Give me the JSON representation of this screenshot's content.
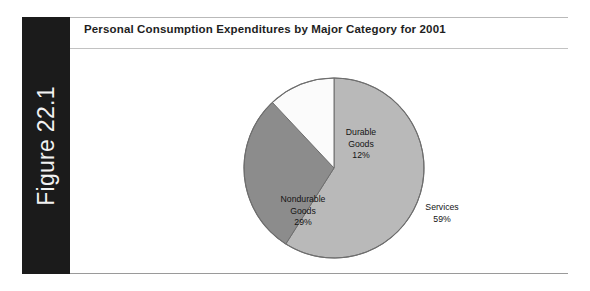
{
  "figure": {
    "number_label": "Figure 22.1",
    "title": "Personal Consumption Expenditures by Major Category for 2001"
  },
  "colors": {
    "tab_background": "#1b1b1b",
    "tab_text": "#f2f2f2",
    "page_background": "#ffffff",
    "rule": "#b9b9b9",
    "slice_services": "#b9b9b9",
    "slice_nondurable": "#8c8c8c",
    "slice_durable": "#fbfbfb",
    "slice_outline": "#6e6e6e",
    "title_text": "#1e1e1e",
    "label_text": "#141414"
  },
  "chart_data": {
    "type": "pie",
    "title": "Personal Consumption Expenditures by Major Category for 2001",
    "subtitle": "",
    "xlabel": "",
    "ylabel": "",
    "legend": "none",
    "grid": false,
    "start_angle_deg": 0,
    "direction": "clockwise",
    "categories": [
      "Services",
      "Nondurable Goods",
      "Durable Goods"
    ],
    "values": [
      59,
      29,
      12
    ],
    "units": "percent",
    "slices": [
      {
        "name": "Services",
        "label_line1": "Services",
        "label_line2": "",
        "value": 59,
        "value_label": "59%",
        "color": "#b9b9b9"
      },
      {
        "name": "Nondurable Goods",
        "label_line1": "Nondurable",
        "label_line2": "Goods",
        "value": 29,
        "value_label": "29%",
        "color": "#8c8c8c"
      },
      {
        "name": "Durable Goods",
        "label_line1": "Durable",
        "label_line2": "Goods",
        "value": 12,
        "value_label": "12%",
        "color": "#fbfbfb"
      }
    ]
  }
}
